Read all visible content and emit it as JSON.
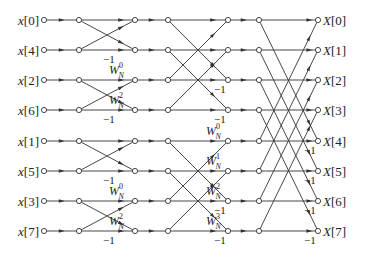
{
  "diagram": {
    "type": "8-point radix-2 decimation-in-time FFT flow graph",
    "colors": {
      "line": "#333333",
      "node_fill": "#ffffff",
      "text": "#222222"
    },
    "columns_x": [
      44,
      79,
      135,
      168,
      228,
      259,
      318
    ],
    "rows_y": [
      20,
      50,
      80,
      110,
      141,
      171,
      201,
      231
    ],
    "inputs": [
      "x[0]",
      "x[4]",
      "x[2]",
      "x[6]",
      "x[1]",
      "x[5]",
      "x[3]",
      "x[7]"
    ],
    "outputs": [
      "X[0]",
      "X[1]",
      "X[2]",
      "X[3]",
      "X[4]",
      "X[5]",
      "X[6]",
      "X[7]"
    ],
    "stage1_minus_one_rows": [
      1,
      3,
      5,
      7
    ],
    "stage2_twiddles": [
      {
        "row": 2,
        "base": "W",
        "sub": "N",
        "sup": "0"
      },
      {
        "row": 3,
        "base": "W",
        "sub": "N",
        "sup": "2"
      },
      {
        "row": 6,
        "base": "W",
        "sub": "N",
        "sup": "0"
      },
      {
        "row": 7,
        "base": "W",
        "sub": "N",
        "sup": "2"
      }
    ],
    "stage2_minus_one_rows": [
      2,
      3,
      6,
      7
    ],
    "stage3_twiddles": [
      {
        "row": 4,
        "base": "W",
        "sub": "N",
        "sup": "0"
      },
      {
        "row": 5,
        "base": "W",
        "sub": "N",
        "sup": "1"
      },
      {
        "row": 6,
        "base": "W",
        "sub": "N",
        "sup": "2"
      },
      {
        "row": 7,
        "base": "W",
        "sub": "N",
        "sup": "3"
      }
    ],
    "stage3_minus_one_rows": [
      4,
      5,
      6,
      7
    ],
    "minus_one_label": "−1"
  }
}
